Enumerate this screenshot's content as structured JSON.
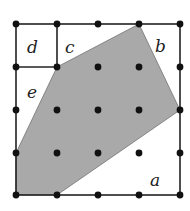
{
  "diagram": {
    "type": "lattice-polygon",
    "grid": {
      "columns": 5,
      "rows": 5,
      "x_positions": [
        16,
        57,
        98,
        139,
        180
      ],
      "y_positions": [
        24,
        67,
        110,
        153,
        195
      ]
    },
    "colors": {
      "line": "#222222",
      "dot": "#111111",
      "shaded": "#a9a9a9",
      "background": "#ffffff"
    },
    "polygon": {
      "description": "shaded hexagon with vertices on lattice points",
      "vertices_grid": [
        [
          3,
          0
        ],
        [
          4,
          2
        ],
        [
          1,
          4
        ],
        [
          0,
          4
        ],
        [
          0,
          3
        ],
        [
          1,
          1
        ]
      ]
    },
    "regions": [
      {
        "label": "a",
        "x": 153,
        "y": 181
      },
      {
        "label": "b",
        "x": 160,
        "y": 52
      },
      {
        "label": "c",
        "x": 68,
        "y": 52
      },
      {
        "label": "d",
        "x": 31,
        "y": 52
      },
      {
        "label": "e",
        "x": 30,
        "y": 98
      }
    ]
  }
}
